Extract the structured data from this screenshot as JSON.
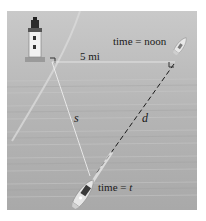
{
  "figure": {
    "labels": {
      "distance": "5 mi",
      "time_noon": "time = noon",
      "time_t_prefix": "time = ",
      "time_t_var": "t",
      "s": "s",
      "d": "d"
    },
    "elements": {
      "lighthouse": "lighthouse",
      "boat_noon": "boat at noon",
      "boat_t": "boat at time t"
    },
    "colors": {
      "water": "#b8b8b8",
      "line": "#ffffff",
      "dashed_line": "#1a1a1a",
      "text": "#1a1a1a"
    }
  }
}
